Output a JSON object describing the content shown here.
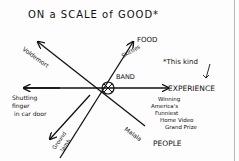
{
  "title": "ON a SCALE of GOOD*",
  "center_label": "BAND",
  "axes": [
    {
      "id": "food",
      "label": "FOOD",
      "direction": "up-right",
      "annotation": "Skittles"
    },
    {
      "id": "experience",
      "label": "EXPERIENCE",
      "direction": "right",
      "annotation": "Winning America's Funniest Home Video Grand Prize"
    },
    {
      "id": "people",
      "label": "PEOPLE",
      "direction": "down-right",
      "annotation": "Malala"
    },
    {
      "id": "voldemort",
      "label": "",
      "direction": "up-left",
      "annotation": "Voldemort"
    },
    {
      "id": "shutting",
      "label": "",
      "direction": "left",
      "annotation": "Shutting finger in car door"
    },
    {
      "id": "ground-lamb",
      "label": "",
      "direction": "down-left",
      "annotation": "Ground lamb"
    }
  ],
  "footnote": "*This kind",
  "colors": {
    "ink": "#111111",
    "paper": "#fdfdfd",
    "border": "#b8b8b8"
  }
}
